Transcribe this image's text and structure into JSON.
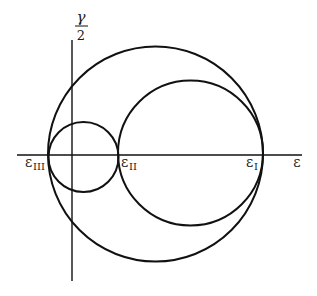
{
  "diagram": {
    "type": "mohr-circles",
    "axes": {
      "horizontal_label": "ε",
      "vertical_label_numerator": "γ",
      "vertical_label_denominator": "2"
    },
    "points": [
      {
        "symbol": "ε",
        "subscript": "III"
      },
      {
        "symbol": "ε",
        "subscript": "II"
      },
      {
        "symbol": "ε",
        "subscript": "I"
      }
    ],
    "circles": [
      {
        "name": "outer",
        "spans": "εIII to εI"
      },
      {
        "name": "large-inner",
        "spans": "εII to εI"
      },
      {
        "name": "small-inner",
        "spans": "εIII to εII"
      }
    ],
    "colors": {
      "stroke": "#111111",
      "background": "#ffffff"
    }
  }
}
